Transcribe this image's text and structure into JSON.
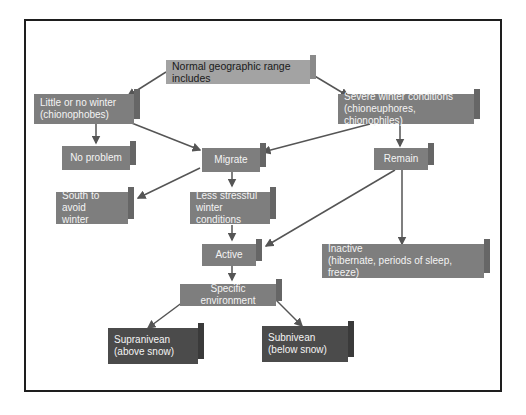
{
  "colors": {
    "frame": "#1e1e1e",
    "top_box": "#a3a3a3",
    "mid_box": "#7e7e7e",
    "dark_box": "#4b4b4b",
    "arrow": "#555555"
  },
  "nodes": {
    "root": "Normal geographic range includes",
    "little_winter": "Little or no winter\n(chionophobes)",
    "severe_winter": "Severe winter conditions\n(chioneuphores, chionophiles)",
    "no_problem": "No problem",
    "migrate": "Migrate",
    "remain": "Remain",
    "south": "South to avoid\nwinter",
    "less_stressful": "Less stressful\nwinter conditions",
    "active": "Active",
    "inactive": "Inactive\n(hibernate, periods of sleep, freeze)",
    "specific_env": "Specific environment",
    "supranivean": "Supranivean\n(above snow)",
    "subnivean": "Subnivean\n(below snow)"
  }
}
